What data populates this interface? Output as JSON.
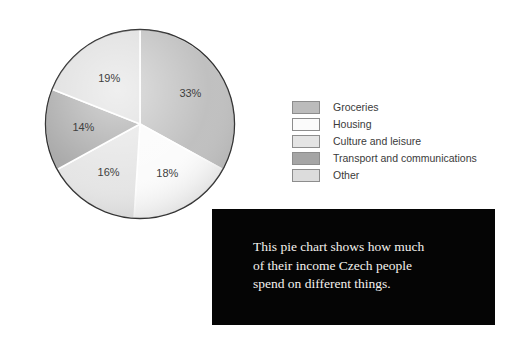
{
  "chart_data": {
    "type": "pie",
    "title": "",
    "subtitle": "",
    "xlabel": "",
    "ylabel": "",
    "legend_position": "right",
    "grid": false,
    "unit": "%",
    "start_angle_deg": 0,
    "direction": "clockwise",
    "categories": [
      "Groceries",
      "Housing",
      "Culture and leisure",
      "Transport and communications",
      "Other"
    ],
    "values": [
      33,
      18,
      16,
      14,
      19
    ],
    "labels": [
      "33%",
      "18%",
      "16%",
      "14%",
      "19%"
    ],
    "colors": [
      "#bcbcbc",
      "#fbfbfb",
      "#e4e4e4",
      "#a5a5a5",
      "#dcdcdc"
    ],
    "slices": [
      {
        "label": "Groceries",
        "value": 33,
        "display": "33%",
        "color": "#bcbcbc"
      },
      {
        "label": "Housing",
        "value": 18,
        "display": "18%",
        "color": "#fbfbfb"
      },
      {
        "label": "Culture and leisure",
        "value": 16,
        "display": "16%",
        "color": "#e4e4e4"
      },
      {
        "label": "Transport and communications",
        "value": 14,
        "display": "14%",
        "color": "#a5a5a5"
      },
      {
        "label": "Other",
        "value": 19,
        "display": "19%",
        "color": "#dcdcdc"
      }
    ]
  },
  "legend": {
    "items": [
      {
        "label": "Groceries",
        "color": "#bcbcbc"
      },
      {
        "label": "Housing",
        "color": "#fbfbfb"
      },
      {
        "label": "Culture and leisure",
        "color": "#e4e4e4"
      },
      {
        "label": "Transport and communications",
        "color": "#a5a5a5"
      },
      {
        "label": "Other",
        "color": "#dcdcdc"
      }
    ]
  },
  "caption": {
    "text": "This pie chart shows how much\nof their income Czech people\nspend on different things.",
    "background": "#050505",
    "color": "#f4f2ee"
  }
}
